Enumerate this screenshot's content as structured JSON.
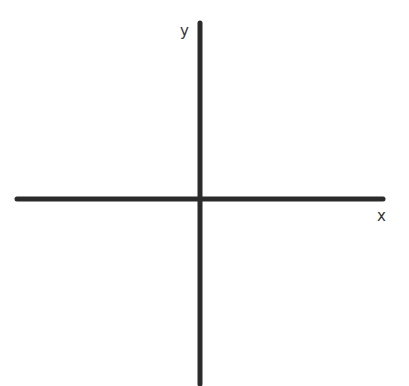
{
  "diagram": {
    "type": "coordinate-axes",
    "axes": {
      "x_label": "x",
      "y_label": "y"
    },
    "colors": {
      "axis": "#2b2b2b",
      "label": "#333333",
      "background": "#ffffff"
    }
  }
}
